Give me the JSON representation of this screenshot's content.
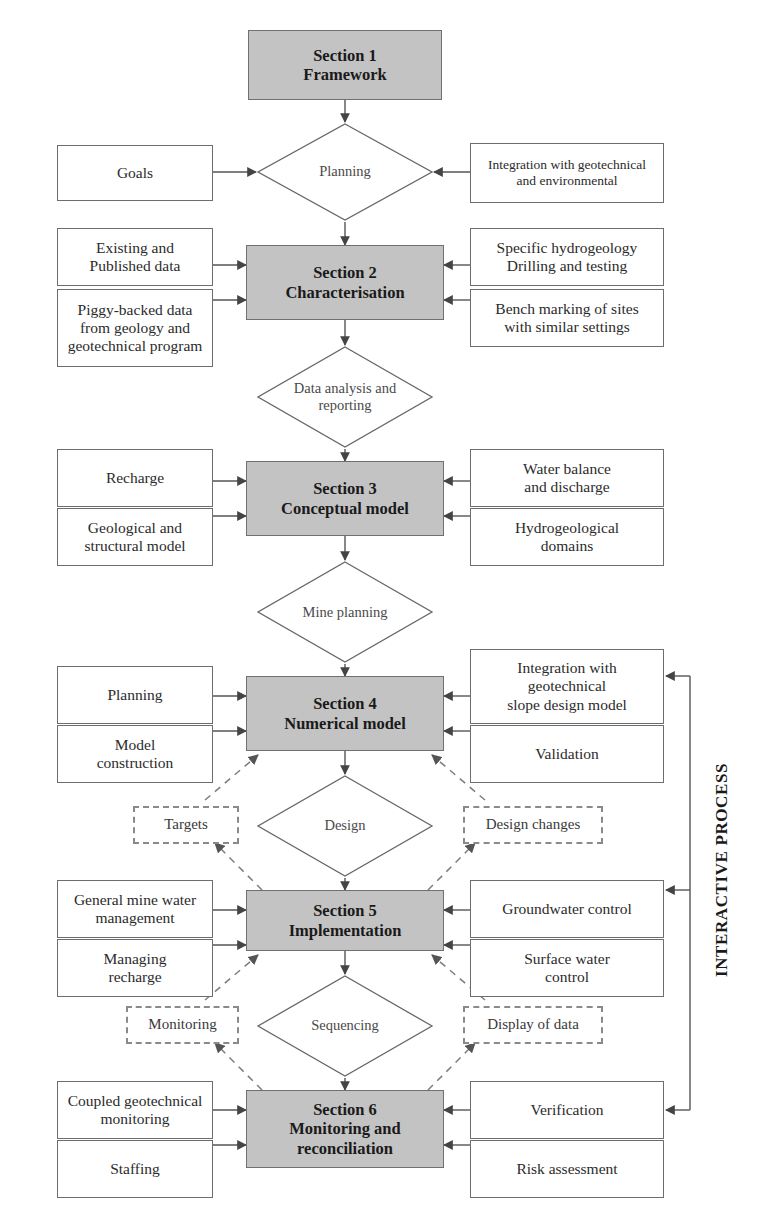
{
  "diagram": {
    "side_caption": "INTERACTIVE PROCESS",
    "colors": {
      "section_fill": "#c3c3c3",
      "box_stroke": "#6d6d6d",
      "line": "#555555",
      "dashed_line": "#8a8a8a",
      "text": "#2b2b2b"
    }
  },
  "sections": [
    {
      "id": "section1",
      "number": "Section 1",
      "name": "Framework"
    },
    {
      "id": "section2",
      "number": "Section 2",
      "name": "Characterisation"
    },
    {
      "id": "section3",
      "number": "Section 3",
      "name": "Conceptual model"
    },
    {
      "id": "section4",
      "number": "Section 4",
      "name": "Numerical model"
    },
    {
      "id": "section5",
      "number": "Section 5",
      "name": "Implementation"
    },
    {
      "id": "section6",
      "number": "Section 6",
      "name_line1": "Monitoring and",
      "name_line2": "reconciliation"
    }
  ],
  "decisions": [
    {
      "id": "planning",
      "line1": "Planning",
      "line2": ""
    },
    {
      "id": "data_analysis",
      "line1": "Data analysis",
      "line2": "and reporting"
    },
    {
      "id": "mine_planning",
      "line1": "Mine",
      "line2": "planning"
    },
    {
      "id": "design",
      "line1": "Design",
      "line2": ""
    },
    {
      "id": "sequencing",
      "line1": "Sequencing",
      "line2": ""
    }
  ],
  "left_inputs": [
    {
      "id": "goals",
      "line1": "Goals",
      "line2": "",
      "line3": ""
    },
    {
      "id": "existing_data",
      "line1": "Existing and",
      "line2": "Published data",
      "line3": ""
    },
    {
      "id": "piggy_backed",
      "line1": "Piggy-backed data",
      "line2": "from geology and",
      "line3": "geotechnical  program"
    },
    {
      "id": "recharge",
      "line1": "Recharge",
      "line2": "",
      "line3": ""
    },
    {
      "id": "geological_model",
      "line1": "Geological and",
      "line2": "structural model",
      "line3": ""
    },
    {
      "id": "planning_input",
      "line1": "Planning",
      "line2": "",
      "line3": ""
    },
    {
      "id": "model_construction",
      "line1": "Model",
      "line2": "construction",
      "line3": ""
    },
    {
      "id": "mine_water_mgmt",
      "line1": "General mine water",
      "line2": "management",
      "line3": ""
    },
    {
      "id": "managing_recharge",
      "line1": "Managing",
      "line2": "recharge",
      "line3": ""
    },
    {
      "id": "coupled_monitoring",
      "line1": "Coupled geotechnical",
      "line2": "monitoring",
      "line3": ""
    },
    {
      "id": "staffing",
      "line1": "Staffing",
      "line2": "",
      "line3": ""
    }
  ],
  "right_inputs": [
    {
      "id": "integration_env",
      "line1": "Integration with geotechnical",
      "line2": "and environmental",
      "line3": ""
    },
    {
      "id": "specific_hydro",
      "line1": "Specific hydrogeology",
      "line2": "Drilling and testing",
      "line3": ""
    },
    {
      "id": "bench_marking",
      "line1": "Bench marking of sites",
      "line2": "with similar settings",
      "line3": ""
    },
    {
      "id": "water_balance",
      "line1": "Water balance",
      "line2": "and discharge",
      "line3": ""
    },
    {
      "id": "hydro_domains",
      "line1": "Hydrogeological",
      "line2": "domains",
      "line3": ""
    },
    {
      "id": "integration_slope",
      "line1": "Integration with",
      "line2": "geotechnical",
      "line3": "slope design model"
    },
    {
      "id": "validation",
      "line1": "Validation",
      "line2": "",
      "line3": ""
    },
    {
      "id": "groundwater_control",
      "line1": "Groundwater control",
      "line2": "",
      "line3": ""
    },
    {
      "id": "surface_water",
      "line1": "Surface water",
      "line2": "control",
      "line3": ""
    },
    {
      "id": "verification",
      "line1": "Verification",
      "line2": "",
      "line3": ""
    },
    {
      "id": "risk_assessment",
      "line1": "Risk assessment",
      "line2": "",
      "line3": ""
    }
  ],
  "feedback_nodes": [
    {
      "id": "targets",
      "label": "Targets"
    },
    {
      "id": "design_changes",
      "label": "Design changes"
    },
    {
      "id": "monitoring",
      "label": "Monitoring"
    },
    {
      "id": "display_of_data",
      "label": "Display of data"
    }
  ]
}
